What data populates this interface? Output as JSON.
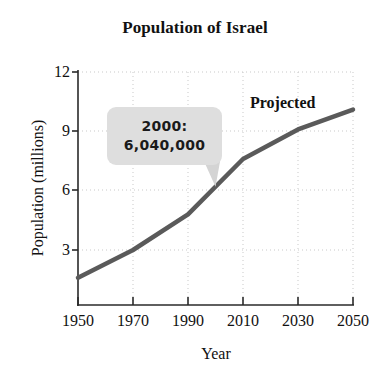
{
  "chart_data": {
    "type": "line",
    "title": "Population of Israel",
    "xlabel": "Year",
    "ylabel": "Population (millions)",
    "x": [
      1950,
      1970,
      1990,
      2010,
      2030,
      2050
    ],
    "values": [
      1.6,
      3.0,
      4.8,
      7.6,
      9.1,
      10.1
    ],
    "series": [
      {
        "name": "Population of Israel",
        "values": [
          1.6,
          3.0,
          4.8,
          7.6,
          9.1,
          10.1
        ]
      }
    ],
    "xlim": [
      1950,
      2050
    ],
    "ylim": [
      0,
      12
    ],
    "xticks": [
      "1950",
      "1970",
      "1990",
      "2010",
      "2030",
      "2050"
    ],
    "yticks": [
      "3",
      "6",
      "9",
      "12"
    ],
    "ytick_values": [
      3,
      6,
      9,
      12
    ],
    "grid": true,
    "legend": null,
    "line_color": "#5a5a5a",
    "annotations": [
      {
        "name": "callout",
        "line1": "2000:",
        "line2": "6,040,000",
        "box_color": "#dedede",
        "points_at_year": 2000
      },
      {
        "name": "projected",
        "text": "Projected"
      }
    ]
  }
}
